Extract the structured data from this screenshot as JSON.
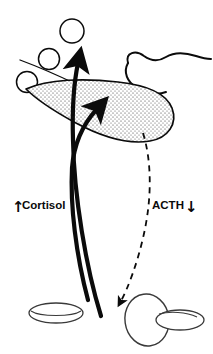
{
  "figure": {
    "background_color": "#ffffff",
    "ink_color": "#0b0b0b",
    "stipple_fill_color": "#f4f4f4"
  },
  "labels": {
    "cortisol": {
      "text": "Cortisol",
      "direction_glyph": "↑",
      "direction": "increased",
      "x": 22,
      "y": 209
    },
    "acth": {
      "text": "ACTH",
      "direction_glyph": "↓",
      "direction": "decreased",
      "x": 152,
      "y": 209
    }
  },
  "structures": {
    "hypothalamus_pituitary": {
      "name": "stippled-gland",
      "fill": "stippled"
    },
    "wavy_tract": {
      "name": "wavy-neural-tract"
    },
    "adrenal_left": {
      "name": "flat-ellipse-gland"
    },
    "adrenal_right": {
      "name": "oval-gland-pair"
    },
    "hormone_molecules": {
      "name": "hormone-circles",
      "count": 3
    }
  },
  "connectors": {
    "cortisol_arrows": {
      "name": "cortisol-feedback-arrows",
      "style": "solid-thick",
      "count": 2,
      "direction": "upward"
    },
    "acth_arrow": {
      "name": "acth-suppressed-arrow",
      "style": "dashed",
      "direction": "downward"
    },
    "thin_guide": {
      "name": "thin-guide-line",
      "style": "solid-thin"
    }
  }
}
